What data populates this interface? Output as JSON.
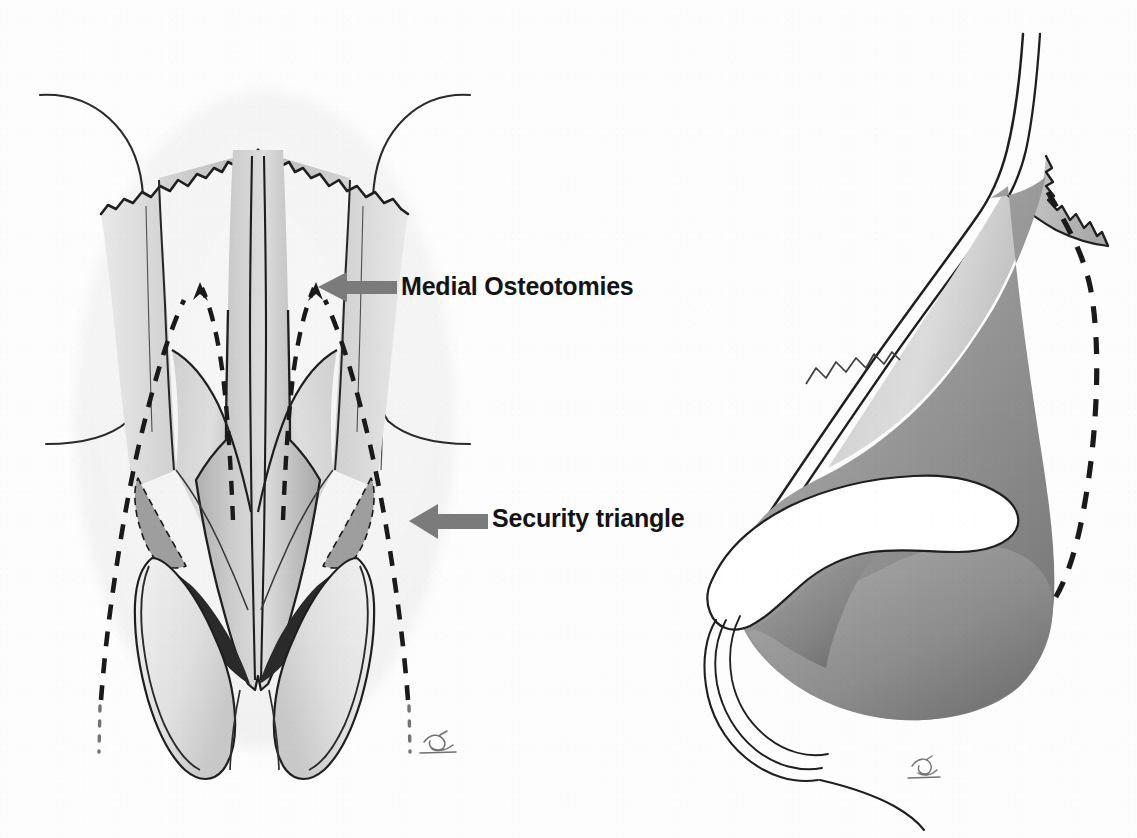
{
  "figure": {
    "background_color": "#fdfdfd",
    "ink_color": "#1a1a1a",
    "arrow_color": "#7b7b7b",
    "label_color": "#141414",
    "panels": [
      {
        "id": "frontal-view",
        "name": "frontal-basal-nasal-skeleton-view",
        "description": "Frontal view of the nasal skeleton showing nasal bones, upper lateral cartilages, septum and lower lateral cartilages with dashed osteotomy lines"
      },
      {
        "id": "lateral-view",
        "name": "lateral-profile-nasal-view",
        "description": "Lateral profile view of the nose showing the bony pyramid, the osteotomy dashed line and the alar rim"
      }
    ],
    "annotations": [
      {
        "id": "medial-osteotomies",
        "label": "Medial Osteotomies",
        "arrow": "arrow-left",
        "tip_x": 318,
        "tip_y": 287,
        "tail_x": 396,
        "tail_y": 287
      },
      {
        "id": "security-triangle",
        "label": "Security triangle",
        "arrow": "arrow-left",
        "tip_x": 409,
        "tip_y": 521,
        "tail_x": 487,
        "tail_y": 521
      }
    ],
    "structures": {
      "nasal_bones": "nasal-bones",
      "upper_lateral_cartilage": "upper-lateral-cartilage",
      "septum": "septal-dorsum",
      "lower_lateral_cartilage": "lower-lateral-cartilage",
      "security_triangle_left": "security-triangle-left",
      "security_triangle_right": "security-triangle-right",
      "nostril": "nostril-opening",
      "orbital_rim_left": "orbital-rim-left",
      "orbital_rim_right": "orbital-rim-right"
    },
    "osteotomy_lines": {
      "medial_left": "dashed-medial-osteotomy-left",
      "medial_right": "dashed-medial-osteotomy-right",
      "lateral_left": "dashed-lateral-osteotomy-left",
      "lateral_right": "dashed-lateral-osteotomy-right",
      "transverse_lateral_view": "dashed-osteotomy-lateral-view"
    },
    "signatures": [
      {
        "id": "signature-frontal",
        "x": 436,
        "y": 742
      },
      {
        "id": "signature-lateral",
        "x": 920,
        "y": 772
      }
    ]
  }
}
